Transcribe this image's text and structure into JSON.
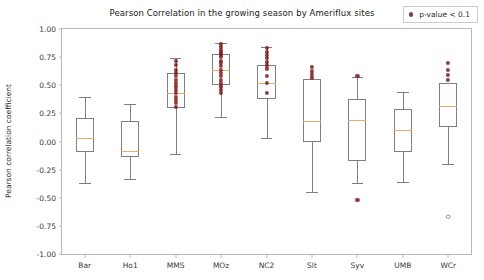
{
  "chart_data": {
    "type": "box",
    "title": "Pearson Correlation in the growing season by Ameriflux sites",
    "xlabel": "",
    "ylabel": "Pearson correlation coefficient",
    "ylim": [
      -1.0,
      1.0
    ],
    "ytick_labels": [
      "1.00",
      "0.75",
      "0.50",
      "0.25",
      "0.00",
      "-0.25",
      "-0.50",
      "-0.75",
      "-1.00"
    ],
    "ytick_values": [
      1.0,
      0.75,
      0.5,
      0.25,
      0.0,
      -0.25,
      -0.5,
      -0.75,
      -1.0
    ],
    "grid": false,
    "legend": {
      "position": "upper right",
      "entries": [
        {
          "label": "p-value < 0.1",
          "color": "#7b1416",
          "marker": "circle"
        }
      ]
    },
    "categories": [
      "Bar",
      "Ho1",
      "MMS",
      "MOz",
      "NC2",
      "Slt",
      "Syv",
      "UMB",
      "WCr"
    ],
    "boxes": [
      {
        "category": "Bar",
        "whisker_low": -0.37,
        "q1": -0.09,
        "median": 0.03,
        "q3": 0.21,
        "whisker_high": 0.4,
        "points": [],
        "fliers": []
      },
      {
        "category": "Ho1",
        "whisker_low": -0.33,
        "q1": -0.14,
        "median": -0.08,
        "q3": 0.18,
        "whisker_high": 0.33,
        "points": [],
        "fliers": []
      },
      {
        "category": "MMS",
        "whisker_low": -0.11,
        "q1": 0.3,
        "median": 0.43,
        "q3": 0.61,
        "whisker_high": 0.74,
        "points": [
          0.72,
          0.68,
          0.64,
          0.61,
          0.58,
          0.55,
          0.52,
          0.49,
          0.46,
          0.43,
          0.4,
          0.37,
          0.34,
          0.31
        ],
        "fliers": []
      },
      {
        "category": "MOz",
        "whisker_low": 0.22,
        "q1": 0.5,
        "median": 0.64,
        "q3": 0.78,
        "whisker_high": 0.88,
        "points": [
          0.87,
          0.84,
          0.81,
          0.79,
          0.77,
          0.75,
          0.72,
          0.7,
          0.67,
          0.64,
          0.61,
          0.58,
          0.55,
          0.52,
          0.49,
          0.46,
          0.43
        ],
        "fliers": []
      },
      {
        "category": "NC2",
        "whisker_low": 0.03,
        "q1": 0.38,
        "median": 0.52,
        "q3": 0.68,
        "whisker_high": 0.84,
        "points": [
          0.83,
          0.8,
          0.77,
          0.74,
          0.71,
          0.68,
          0.65,
          0.58,
          0.52,
          0.43
        ],
        "fliers": []
      },
      {
        "category": "Slt",
        "whisker_low": -0.45,
        "q1": 0.0,
        "median": 0.18,
        "q3": 0.56,
        "whisker_high": 0.56,
        "points": [
          0.66,
          0.63,
          0.6,
          0.57
        ],
        "fliers": []
      },
      {
        "category": "Syv",
        "whisker_low": -0.37,
        "q1": -0.17,
        "median": 0.19,
        "q3": 0.38,
        "whisker_high": 0.57,
        "points": [
          0.58,
          -0.52
        ],
        "fliers": []
      },
      {
        "category": "UMB",
        "whisker_low": -0.36,
        "q1": -0.09,
        "median": 0.1,
        "q3": 0.29,
        "whisker_high": 0.44,
        "points": [],
        "fliers": []
      },
      {
        "category": "WCr",
        "whisker_low": -0.2,
        "q1": 0.13,
        "median": 0.32,
        "q3": 0.52,
        "whisker_high": 0.52,
        "points": [
          0.7,
          0.64,
          0.59,
          0.55
        ],
        "fliers": [
          -0.67
        ]
      }
    ]
  }
}
